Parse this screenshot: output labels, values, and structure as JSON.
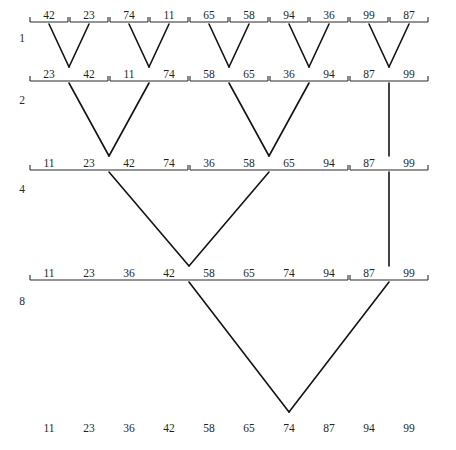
{
  "diagram": {
    "level_labels": [
      "1",
      "2",
      "4",
      "8"
    ],
    "level_label_x": 22,
    "colors": {
      "ink": "#131313",
      "rule": "#2b2b2b",
      "background": "#ffffff"
    },
    "slot_xs": [
      49,
      89,
      129,
      169,
      209,
      249,
      289,
      329,
      369,
      409
    ],
    "rows": [
      {
        "name": "row-run-size-1",
        "label": "1",
        "label_y": 42,
        "rule_y": 22,
        "text_y": 19,
        "groups": [
          {
            "values": [
              "42"
            ],
            "slots": [
              0
            ]
          },
          {
            "values": [
              "23"
            ],
            "slots": [
              1
            ]
          },
          {
            "values": [
              "74"
            ],
            "slots": [
              2
            ]
          },
          {
            "values": [
              "11"
            ],
            "slots": [
              3
            ]
          },
          {
            "values": [
              "65"
            ],
            "slots": [
              4
            ]
          },
          {
            "values": [
              "58"
            ],
            "slots": [
              5
            ]
          },
          {
            "values": [
              "94"
            ],
            "slots": [
              6
            ]
          },
          {
            "values": [
              "36"
            ],
            "slots": [
              7
            ]
          },
          {
            "values": [
              "99"
            ],
            "slots": [
              8
            ]
          },
          {
            "values": [
              "87"
            ],
            "slots": [
              9
            ]
          }
        ]
      },
      {
        "name": "row-run-size-2",
        "label": "2",
        "label_y": 104,
        "rule_y": 81,
        "text_y": 78,
        "groups": [
          {
            "values": [
              "23",
              "42"
            ],
            "slots": [
              0,
              1
            ]
          },
          {
            "values": [
              "11",
              "74"
            ],
            "slots": [
              2,
              3
            ]
          },
          {
            "values": [
              "58",
              "65"
            ],
            "slots": [
              4,
              5
            ]
          },
          {
            "values": [
              "36",
              "94"
            ],
            "slots": [
              6,
              7
            ]
          },
          {
            "values": [
              "87",
              "99"
            ],
            "slots": [
              8,
              9
            ]
          }
        ]
      },
      {
        "name": "row-run-size-4",
        "label": "4",
        "label_y": 193,
        "rule_y": 170,
        "text_y": 167,
        "groups": [
          {
            "values": [
              "11",
              "23",
              "42",
              "74"
            ],
            "slots": [
              0,
              1,
              2,
              3
            ]
          },
          {
            "values": [
              "36",
              "58",
              "65",
              "94"
            ],
            "slots": [
              4,
              5,
              6,
              7
            ]
          },
          {
            "values": [
              "87",
              "99"
            ],
            "slots": [
              8,
              9
            ]
          }
        ]
      },
      {
        "name": "row-run-size-8",
        "label": "8",
        "label_y": 305,
        "rule_y": 280,
        "text_y": 277,
        "groups": [
          {
            "values": [
              "11",
              "23",
              "36",
              "42",
              "58",
              "65",
              "74",
              "94"
            ],
            "slots": [
              0,
              1,
              2,
              3,
              4,
              5,
              6,
              7
            ]
          },
          {
            "values": [
              "87",
              "99"
            ],
            "slots": [
              8,
              9
            ]
          }
        ]
      },
      {
        "name": "row-final-sorted",
        "label": "",
        "label_y": 0,
        "rule_y": 0,
        "text_y": 432,
        "groups": [
          {
            "values": [
              "11",
              "23",
              "36",
              "42",
              "58",
              "65",
              "74",
              "87",
              "94",
              "99"
            ],
            "slots": [
              0,
              1,
              2,
              3,
              4,
              5,
              6,
              7,
              8,
              9
            ]
          }
        ]
      }
    ],
    "merge_links": [
      {
        "name": "merge-1-to-2-a",
        "from_x": [
          49,
          89
        ],
        "from_y": 24,
        "to_x": 69,
        "to_y": 67
      },
      {
        "name": "merge-1-to-2-b",
        "from_x": [
          129,
          169
        ],
        "from_y": 24,
        "to_x": 149,
        "to_y": 67
      },
      {
        "name": "merge-1-to-2-c",
        "from_x": [
          209,
          249
        ],
        "from_y": 24,
        "to_x": 229,
        "to_y": 67
      },
      {
        "name": "merge-1-to-2-d",
        "from_x": [
          289,
          329
        ],
        "from_y": 24,
        "to_x": 309,
        "to_y": 67
      },
      {
        "name": "merge-1-to-2-e",
        "from_x": [
          369,
          409
        ],
        "from_y": 24,
        "to_x": 389,
        "to_y": 67
      },
      {
        "name": "merge-2-to-4-a",
        "from_x": [
          69,
          149
        ],
        "from_y": 83,
        "to_x": 109,
        "to_y": 156
      },
      {
        "name": "merge-2-to-4-b",
        "from_x": [
          229,
          309
        ],
        "from_y": 83,
        "to_x": 269,
        "to_y": 156
      },
      {
        "name": "carry-2-to-4-c",
        "from_x": [
          389
        ],
        "from_y": 83,
        "to_x": 389,
        "to_y": 156
      },
      {
        "name": "merge-4-to-8-a",
        "from_x": [
          109,
          269
        ],
        "from_y": 172,
        "to_x": 189,
        "to_y": 266
      },
      {
        "name": "carry-4-to-8-b",
        "from_x": [
          389
        ],
        "from_y": 172,
        "to_x": 389,
        "to_y": 266
      },
      {
        "name": "merge-8-to-final",
        "from_x": [
          189,
          389
        ],
        "from_y": 282,
        "to_x": 289,
        "to_y": 412
      }
    ]
  }
}
